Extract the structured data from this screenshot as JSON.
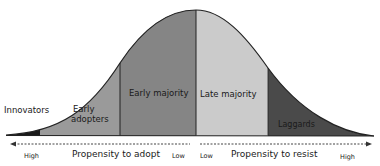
{
  "diagram": {
    "segments": [
      {
        "id": "innovators",
        "label": "Innovators",
        "color": "#1a1a1a"
      },
      {
        "id": "early-adopters",
        "label_line1": "Early",
        "label_line2": "adopters",
        "color": "#9a9a9a"
      },
      {
        "id": "early-majority",
        "label": "Early majority",
        "color": "#8a8a8a"
      },
      {
        "id": "late-majority",
        "label": "Late majority",
        "color": "#c8c8c8"
      },
      {
        "id": "laggards",
        "label": "Laggards",
        "color": "#4a4a4a"
      }
    ],
    "axis_left": {
      "label": "Propensity to adopt",
      "start": "High",
      "end": "Low"
    },
    "axis_right": {
      "label": "Propensity to resist",
      "start": "Low",
      "end": "High"
    }
  }
}
